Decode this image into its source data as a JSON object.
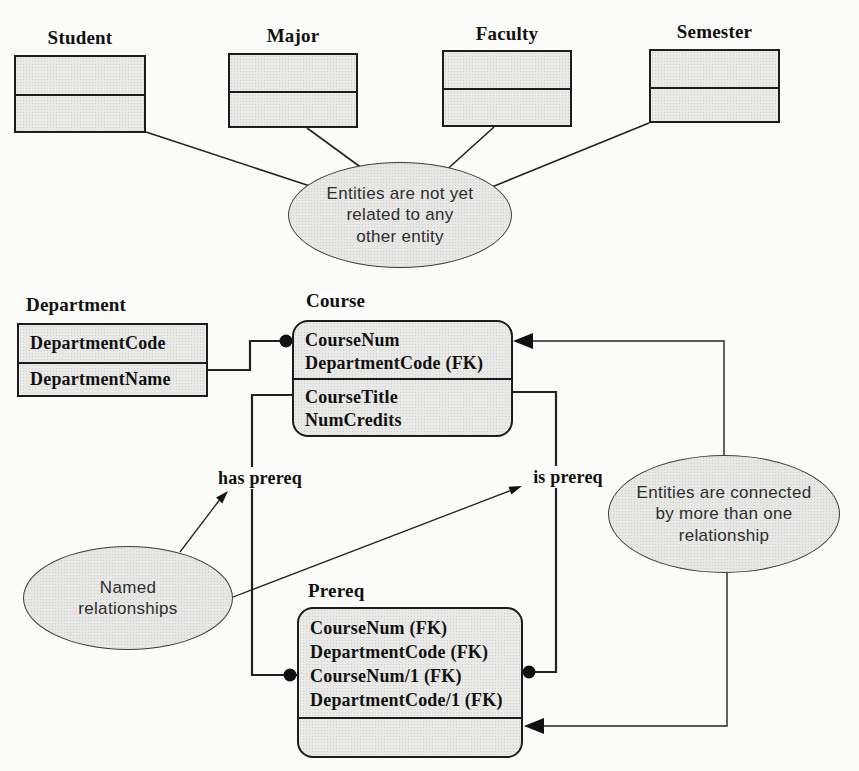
{
  "entities": [
    {
      "label": "Student"
    },
    {
      "label": "Major"
    },
    {
      "label": "Faculty"
    },
    {
      "label": "Semester"
    }
  ],
  "tables": {
    "department": {
      "title": "Department",
      "key_rows": [
        "DepartmentCode"
      ],
      "rows": [
        "DepartmentName"
      ]
    },
    "course": {
      "title": "Course",
      "key_rows": [
        "CourseNum",
        "DepartmentCode (FK)"
      ],
      "rows": [
        "CourseTitle",
        "NumCredits"
      ]
    },
    "prereq": {
      "title": "Prereq",
      "key_rows": [
        "CourseNum (FK)",
        "DepartmentCode (FK)",
        "CourseNum/1 (FK)",
        "DepartmentCode/1 (FK)"
      ],
      "rows": []
    }
  },
  "labels": {
    "has_prereq": "has prereq",
    "is_prereq": "is prereq"
  },
  "callouts": {
    "unrelated": {
      "lines": [
        "Entities are not yet",
        "related to any",
        "other entity"
      ]
    },
    "named": {
      "lines": [
        "Named",
        "relationships"
      ]
    },
    "multi": {
      "lines": [
        "Entities are connected",
        "by more than one",
        "relationship"
      ]
    }
  },
  "colors": {
    "background": "#fbfbf9",
    "box_fill": "#e7e7e5",
    "box_border": "#1c1c1c",
    "line": "#222222",
    "text": "#111111",
    "callout_text": "#2e2e2e"
  }
}
